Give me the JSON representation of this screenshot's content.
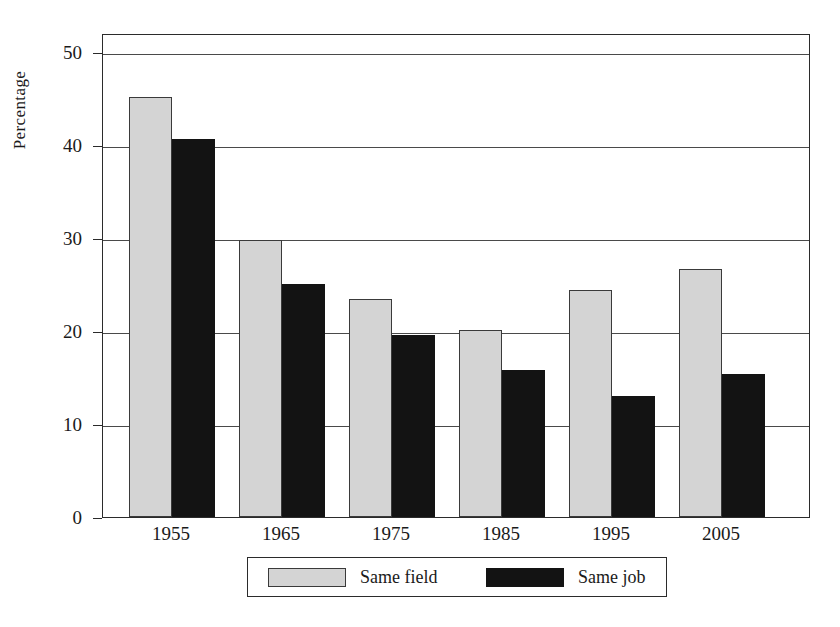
{
  "chart_data": {
    "type": "bar",
    "title": "",
    "subtitle": "",
    "xlabel": "",
    "ylabel": "Percentage",
    "categories": [
      "1955",
      "1965",
      "1975",
      "1985",
      "1995",
      "2005"
    ],
    "series": [
      {
        "name": "Same field",
        "color": "#d4d4d4",
        "values": [
          45.1,
          29.8,
          23.4,
          20.1,
          24.4,
          26.7
        ]
      },
      {
        "name": "Same job",
        "color": "#131313",
        "values": [
          40.6,
          25.0,
          19.6,
          15.8,
          13.0,
          15.4
        ]
      }
    ],
    "ylim": [
      0,
      52
    ],
    "yticks": [
      0,
      10,
      20,
      30,
      40,
      50
    ],
    "ytick_labels": [
      "0",
      "10",
      "20",
      "30",
      "40",
      "50"
    ],
    "grid": "horizontal",
    "legend_position": "bottom-center"
  },
  "legend": {
    "entries": [
      {
        "label": "Same field",
        "swatch": "light-grey"
      },
      {
        "label": "Same job",
        "swatch": "black"
      }
    ]
  },
  "axes": {
    "y_title": "Percentage"
  }
}
